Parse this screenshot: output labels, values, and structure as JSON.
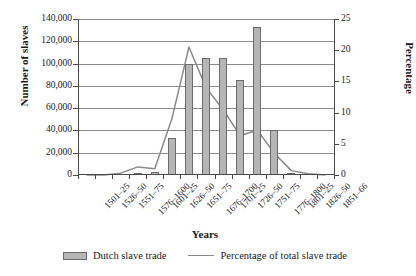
{
  "chart_data": {
    "type": "bar",
    "title": "",
    "xlabel": "Years",
    "ylabel": "Number of slaves",
    "ylabel_right": "Percentage",
    "categories": [
      "1501–25",
      "1526–50",
      "1551–75",
      "1576–1600",
      "1601–25",
      "1626–50",
      "1651–75",
      "1676–1700",
      "1701–25",
      "1726–50",
      "1751–75",
      "1776–1800",
      "1801–25",
      "1826–50",
      "1851–66"
    ],
    "ylim": [
      0,
      140000
    ],
    "ylim_right": [
      0,
      25
    ],
    "yticks": [
      "0",
      "20,000",
      "40,000",
      "60,000",
      "80,000",
      "100,000",
      "120,000",
      "140,000"
    ],
    "ytick_values": [
      0,
      20000,
      40000,
      60000,
      80000,
      100000,
      120000,
      140000
    ],
    "yticks_right": [
      "0",
      "5",
      "10",
      "15",
      "20",
      "25"
    ],
    "ytick_values_right": [
      0,
      5,
      10,
      15,
      20,
      25
    ],
    "grid": true,
    "legend_position": "bottom",
    "series": [
      {
        "name": "Dutch slave trade",
        "type": "bar",
        "axis": "left",
        "color": "#b6b6b6",
        "edge_color": "#6b6b6b",
        "values": [
          0,
          0,
          500,
          2000,
          2500,
          33000,
          100000,
          105000,
          105000,
          85000,
          133000,
          40000,
          1000,
          0,
          0
        ]
      },
      {
        "name": "Percentage of total slave trade",
        "type": "line",
        "axis": "right",
        "color": "#8a8a8a",
        "values": [
          0,
          0,
          0.3,
          1.3,
          1.0,
          9.0,
          20.5,
          14.0,
          10.5,
          6.3,
          7.2,
          3.5,
          0.7,
          0.2,
          0.0
        ]
      }
    ]
  },
  "legend": {
    "bar_label": "Dutch slave trade",
    "line_label": "Percentage of total slave trade"
  }
}
